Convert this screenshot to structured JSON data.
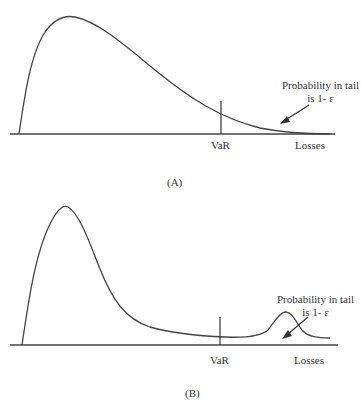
{
  "panels": [
    {
      "id": "A",
      "caption": "(A)",
      "var_label": "VaR",
      "x_label": "Losses",
      "annotation_line1": "Probability in tail",
      "annotation_line2": "is 1- ε"
    },
    {
      "id": "B",
      "caption": "(B)",
      "var_label": "VaR",
      "x_label": "Losses",
      "annotation_line1": "Probability in tail",
      "annotation_line2": "is 1- ε"
    }
  ],
  "colors": {
    "stroke": "#444444",
    "text": "#333333"
  }
}
